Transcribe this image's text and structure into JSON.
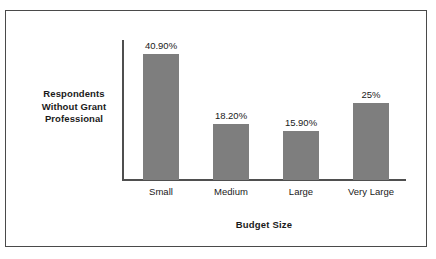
{
  "chart_data": {
    "type": "bar",
    "title": "",
    "xlabel": "Budget Size",
    "ylabel": "Respondents Without Grant Professional",
    "categories": [
      "Small",
      "Medium",
      "Large",
      "Very Large"
    ],
    "values": [
      40.9,
      18.2,
      15.9,
      25
    ],
    "value_labels": [
      "40.90%",
      "18.20%",
      "15.90%",
      "25%"
    ],
    "ylim": [
      0,
      45
    ],
    "grid": false,
    "legend": "none",
    "bar_color": "#7e7e7e",
    "axis_color": "#4f4f4f",
    "frame_color": "#4a4a4a",
    "text_color": "#1a1a1a"
  },
  "axis": {
    "y_title_lines": [
      "Respondents",
      "Without Grant",
      "Professional"
    ],
    "x_title": "Budget Size"
  }
}
